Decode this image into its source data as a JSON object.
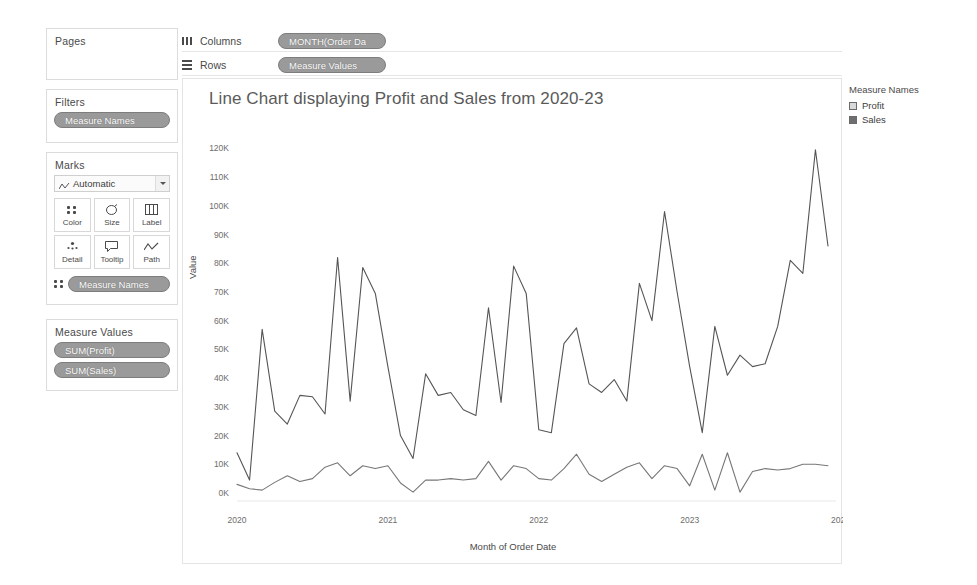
{
  "shelves": {
    "pages": {
      "title": "Pages"
    },
    "filters": {
      "title": "Filters",
      "pill": "Measure Names"
    },
    "columns": {
      "label": "Columns",
      "icon": "columns-icon",
      "pill": "MONTH(Order Da"
    },
    "rows": {
      "label": "Rows",
      "icon": "rows-icon",
      "pill": "Measure Values"
    }
  },
  "marks": {
    "title": "Marks",
    "mark_type": "Automatic",
    "mark_type_icon": "line-mark-icon",
    "buttons": [
      {
        "label": "Color",
        "icon": "color-icon"
      },
      {
        "label": "Size",
        "icon": "size-icon"
      },
      {
        "label": "Label",
        "icon": "label-icon"
      },
      {
        "label": "Detail",
        "icon": "detail-icon"
      },
      {
        "label": "Tooltip",
        "icon": "tooltip-icon"
      },
      {
        "label": "Path",
        "icon": "path-icon"
      }
    ],
    "encoding_pill": "Measure Names",
    "encoding_icon": "color-icon"
  },
  "measure_values": {
    "title": "Measure Values",
    "pills": [
      "SUM(Profit)",
      "SUM(Sales)"
    ]
  },
  "legend": {
    "title": "Measure Names",
    "items": [
      {
        "label": "Profit",
        "color": "#d9d9d9"
      },
      {
        "label": "Sales",
        "color": "#6e6e6e"
      }
    ]
  },
  "chart_data": {
    "type": "line",
    "title": "Line Chart displaying Profit and Sales from 2020-23",
    "xlabel": "Month of Order Date",
    "ylabel": "Value",
    "ylim": [
      0,
      125000
    ],
    "yticks": [
      0,
      10000,
      20000,
      30000,
      40000,
      50000,
      60000,
      70000,
      80000,
      90000,
      100000,
      110000,
      120000
    ],
    "ytick_labels": [
      "0K",
      "10K",
      "20K",
      "30K",
      "40K",
      "50K",
      "60K",
      "70K",
      "80K",
      "90K",
      "100K",
      "110K",
      "120K"
    ],
    "xtick_labels": [
      "2020",
      "2021",
      "2022",
      "2023",
      "2024"
    ],
    "xtick_values": [
      "2020-01",
      "2021-01",
      "2022-01",
      "2023-01",
      "2024-01"
    ],
    "grid": false,
    "legend_position": "right",
    "x": [
      "2020-01",
      "2020-02",
      "2020-03",
      "2020-04",
      "2020-05",
      "2020-06",
      "2020-07",
      "2020-08",
      "2020-09",
      "2020-10",
      "2020-11",
      "2020-12",
      "2021-01",
      "2021-02",
      "2021-03",
      "2021-04",
      "2021-05",
      "2021-06",
      "2021-07",
      "2021-08",
      "2021-09",
      "2021-10",
      "2021-11",
      "2021-12",
      "2022-01",
      "2022-02",
      "2022-03",
      "2022-04",
      "2022-05",
      "2022-06",
      "2022-07",
      "2022-08",
      "2022-09",
      "2022-10",
      "2022-11",
      "2022-12",
      "2023-01",
      "2023-02",
      "2023-03",
      "2023-04",
      "2023-05",
      "2023-06",
      "2023-07",
      "2023-08",
      "2023-09",
      "2023-10",
      "2023-11",
      "2023-12"
    ],
    "series": [
      {
        "name": "Sales",
        "color": "#555555",
        "values": [
          14000,
          4500,
          57000,
          28500,
          24000,
          34000,
          33500,
          27500,
          82000,
          32000,
          78500,
          69500,
          44000,
          20000,
          12000,
          41500,
          34000,
          35000,
          29000,
          27000,
          64500,
          31500,
          79000,
          69500,
          22000,
          21000,
          52000,
          57500,
          38000,
          35000,
          39500,
          32000,
          73000,
          60000,
          98000,
          70000,
          44000,
          21000,
          58000,
          41000,
          48000,
          44000,
          45000,
          58000,
          81000,
          76500,
          119500,
          86000
        ]
      },
      {
        "name": "Profit",
        "color": "#777777",
        "values": [
          3000,
          1500,
          1000,
          3700,
          6000,
          4000,
          5000,
          9000,
          10500,
          6000,
          9500,
          8500,
          9500,
          3500,
          300,
          4500,
          4500,
          5000,
          4500,
          5000,
          11000,
          4500,
          9500,
          8500,
          5000,
          4500,
          8500,
          13500,
          6500,
          4000,
          6500,
          9000,
          10500,
          5000,
          9500,
          8500,
          2500,
          13500,
          1000,
          14000,
          300,
          7500,
          8500,
          8000,
          8500,
          10000,
          10000,
          9500
        ]
      }
    ]
  }
}
